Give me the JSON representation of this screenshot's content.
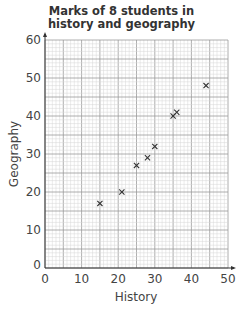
{
  "chart_data": {
    "type": "scatter",
    "title": "Marks of 8 students in history and geography",
    "title_lines": [
      "Marks of 8 students in",
      "history and geography"
    ],
    "xlabel": "History",
    "ylabel": "Geography",
    "xlim": [
      0,
      50
    ],
    "ylim": [
      0,
      60
    ],
    "xticks": [
      0,
      10,
      20,
      30,
      40,
      50
    ],
    "yticks": [
      0,
      10,
      20,
      30,
      40,
      50,
      60
    ],
    "grid": true,
    "marker": "x",
    "points": [
      {
        "x": 15,
        "y": 17
      },
      {
        "x": 21,
        "y": 20
      },
      {
        "x": 25,
        "y": 27
      },
      {
        "x": 28,
        "y": 29
      },
      {
        "x": 30,
        "y": 32
      },
      {
        "x": 35,
        "y": 40
      },
      {
        "x": 36,
        "y": 41
      },
      {
        "x": 44,
        "y": 48
      }
    ]
  },
  "colors": {
    "major_grid": "#9a9a9a",
    "minor_grid": "#d6d6d6",
    "axis": "#333333",
    "marker": "#333333"
  }
}
